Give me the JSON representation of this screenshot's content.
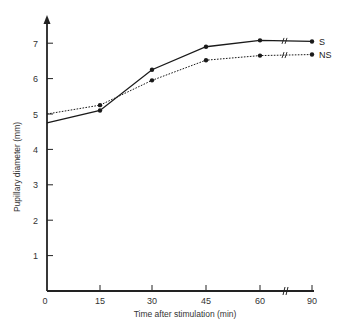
{
  "chart_data": {
    "type": "line",
    "title": "",
    "xlabel": "Time after stimulation (min)",
    "ylabel": "Pupillary diameter (mm)",
    "x": [
      0,
      15,
      30,
      45,
      60,
      90
    ],
    "x_tick_labels": [
      "0",
      "15",
      "30",
      "45",
      "60",
      "90"
    ],
    "y_tick_labels": [
      "1",
      "2",
      "3",
      "4",
      "5",
      "6",
      "7"
    ],
    "ylim": [
      0,
      7.6
    ],
    "axis_break_x": "between 60 and 90",
    "grid": false,
    "legend_position": "inline right end of lines",
    "series": [
      {
        "name": "S",
        "style": "solid",
        "values": [
          4.75,
          5.1,
          6.25,
          6.9,
          7.08,
          7.05
        ]
      },
      {
        "name": "NS",
        "style": "dotted",
        "values": [
          5.0,
          5.25,
          5.95,
          6.52,
          6.65,
          6.68
        ]
      }
    ]
  },
  "labels": {
    "xlabel": "Time after stimulation (min)",
    "ylabel": "Pupillary diameter (mm)",
    "origin": "0",
    "legend_s": "S",
    "legend_ns": "NS"
  },
  "colors": {
    "axis": "#222222",
    "line": "#1a1a1a",
    "text": "#333333"
  }
}
